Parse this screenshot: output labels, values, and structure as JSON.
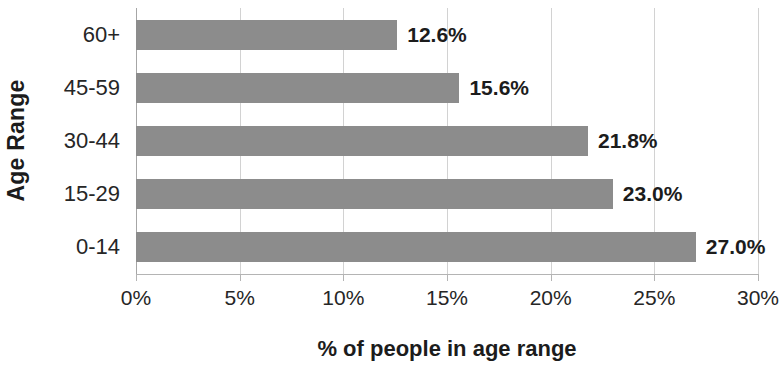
{
  "chart_data": {
    "type": "bar",
    "orientation": "horizontal",
    "title": "",
    "xlabel": "% of people in age range",
    "ylabel": "Age Range",
    "categories": [
      "60+",
      "45-59",
      "30-44",
      "15-29",
      "0-14"
    ],
    "values": [
      12.6,
      15.6,
      21.8,
      23.0,
      27.0
    ],
    "data_labels": [
      "12.6%",
      "15.6%",
      "21.8%",
      "23.0%",
      "27.0%"
    ],
    "xlim": [
      0,
      30
    ],
    "xticks": [
      0,
      5,
      10,
      15,
      20,
      25,
      30
    ],
    "xtick_labels": [
      "0%",
      "5%",
      "10%",
      "15%",
      "20%",
      "25%",
      "30%"
    ],
    "grid": true,
    "grid_axis": "x",
    "legend": false,
    "bar_color": "#8c8c8c",
    "gridline_color": "#d2d2d2",
    "axis_color": "#b4b4b4",
    "label_color": "#1c1c1c",
    "background_color": "#ffffff"
  }
}
